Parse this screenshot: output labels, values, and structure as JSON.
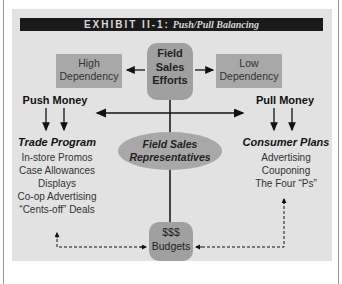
{
  "title": {
    "exhibit": "EXHIBIT II-1:",
    "subtitle": "Push/Pull Balancing"
  },
  "nodes": {
    "high_dependency": [
      "High",
      "Dependency"
    ],
    "field_sales_efforts": [
      "Field",
      "Sales",
      "Efforts"
    ],
    "low_dependency": [
      "Low",
      "Dependency"
    ],
    "push_money": "Push Money",
    "pull_money": "Pull Money",
    "field_sales_reps": [
      "Field Sales",
      "Representatives"
    ],
    "trade_program": {
      "title": "Trade Program",
      "items": [
        "In-store Promos",
        "Case Allowances",
        "Displays",
        "Co-op Advertising",
        "“Cents-off” Deals"
      ]
    },
    "consumer_plans": {
      "title": "Consumer Plans",
      "items": [
        "Advertising",
        "Couponing",
        "The Four “Ps”"
      ]
    },
    "budgets": [
      "$$$",
      "Budgets"
    ]
  },
  "colors": {
    "panel": "#e2e2e2",
    "box": "#a8a8a8",
    "title_bar": "#1a1a1a"
  }
}
